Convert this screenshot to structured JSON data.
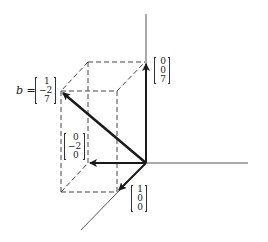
{
  "diagram": {
    "type": "3d-vector-decomposition",
    "vector_b": {
      "name": "b",
      "equals": "=",
      "components": [
        "1",
        "−2",
        "7"
      ]
    },
    "component_vectors": [
      {
        "id": "z-component",
        "components": [
          "0",
          "0",
          "7"
        ]
      },
      {
        "id": "y-component",
        "components": [
          "0",
          "−2",
          "0"
        ]
      },
      {
        "id": "x-component",
        "components": [
          "1",
          "0",
          "0"
        ]
      }
    ],
    "colors": {
      "ink": "#1a1a1a",
      "axis": "#555555",
      "dashed": "#444444",
      "background": "#ffffff"
    }
  }
}
